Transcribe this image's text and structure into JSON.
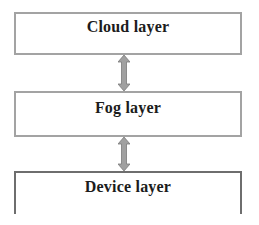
{
  "diagram": {
    "type": "layered-architecture",
    "layers": [
      {
        "label": "Cloud layer"
      },
      {
        "label": "Fog layer"
      },
      {
        "label": "Device layer"
      }
    ],
    "connections": [
      {
        "from": "Cloud layer",
        "to": "Fog layer",
        "style": "bidirectional-arrow"
      },
      {
        "from": "Fog layer",
        "to": "Device layer",
        "style": "bidirectional-arrow"
      }
    ],
    "colors": {
      "box_border": "#a3a3a3",
      "device_box_border": "#6e6e6e",
      "arrow_fill": "#a0a0a0",
      "arrow_stroke": "#7a7a7a",
      "text": "#1c1c1c",
      "background": "#ffffff"
    }
  }
}
